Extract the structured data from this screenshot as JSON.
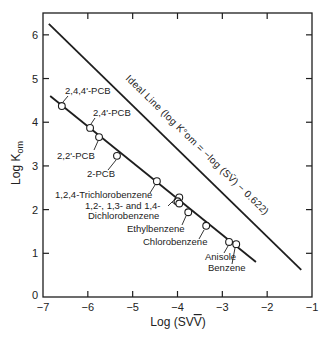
{
  "chart_data": {
    "type": "scatter",
    "title": "",
    "xlabel": "Log (SV̄)",
    "ylabel": "Log K_om",
    "xlim": [
      -7,
      -1
    ],
    "ylim": [
      0,
      6.5
    ],
    "xticks": [
      -7,
      -6,
      -5,
      -4,
      -3,
      -2,
      -1
    ],
    "yticks": [
      0,
      1,
      2,
      3,
      4,
      5,
      6
    ],
    "grid": false,
    "series": [
      {
        "name": "Measured",
        "marker": "open-circle",
        "points": [
          {
            "label": "2,4,4'-PCB",
            "x": -6.58,
            "y": 4.37
          },
          {
            "label": "2,4'-PCB",
            "x": -5.95,
            "y": 3.87
          },
          {
            "label": "2,2'-PCB",
            "x": -5.75,
            "y": 3.66
          },
          {
            "label": "2-PCB",
            "x": -5.35,
            "y": 3.23
          },
          {
            "label": "1,2,4-Trichlorobenzene",
            "x": -4.46,
            "y": 2.65
          },
          {
            "label": "1,2-Dichlorobenzene",
            "x": -3.96,
            "y": 2.28
          },
          {
            "label": "1,3-Dichlorobenzene",
            "x": -4.0,
            "y": 2.19
          },
          {
            "label": "1,4-Dichlorobenzene",
            "x": -3.96,
            "y": 2.14
          },
          {
            "label": "Ethylbenzene",
            "x": -3.76,
            "y": 1.94
          },
          {
            "label": "Chlorobenzene",
            "x": -3.36,
            "y": 1.63
          },
          {
            "label": "Anisole",
            "x": -2.85,
            "y": 1.26
          },
          {
            "label": "Benzene",
            "x": -2.69,
            "y": 1.21
          }
        ]
      },
      {
        "name": "Regression fit",
        "type": "line",
        "x": [
          -6.84,
          -2.25
        ],
        "y": [
          4.6,
          0.8
        ]
      },
      {
        "name": "Ideal Line",
        "type": "line",
        "equation": "log K°om = -log (SV̄) - 0.622",
        "x": [
          -6.87,
          -1.24
        ],
        "y": [
          6.25,
          0.62
        ]
      }
    ],
    "annotations": [
      "2,4,4'-PCB",
      "2,4'-PCB",
      "2,2'-PCB",
      "2-PCB",
      "1,2,4-Trichlorobenzene",
      "1,2-, 1,3- and 1,4-",
      "Dichlorobenzene",
      "Ethylbenzene",
      "Chlorobenzene",
      "Anisole",
      "Benzene",
      "Ideal Line (log K°om = -log (SV̄) - 0.622)"
    ],
    "legend": null
  },
  "labels": {
    "xlabel_main": "Log (SV",
    "xlabel_bar": "V",
    "ylabel_main": "Log K",
    "ylabel_sub": "om",
    "ideal_line": "Ideal Line (log K°om = −log (SV̄) − 0.622)",
    "dichloro_line1": "1,2-, 1,3- and 1,4-",
    "dichloro_line2": "Dichlorobenzene"
  }
}
